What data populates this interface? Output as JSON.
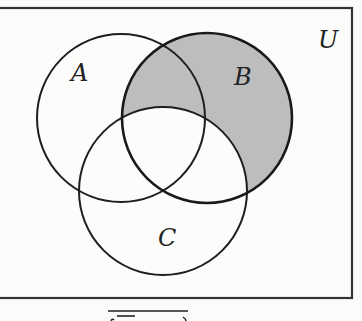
{
  "diagram": {
    "type": "venn",
    "universe": {
      "label": "U",
      "border_color": "#333333",
      "box": {
        "x": -4,
        "y": 8,
        "width": 356,
        "height": 290
      }
    },
    "sets": [
      {
        "id": "A",
        "label": "A",
        "cx": 121,
        "cy": 118,
        "r": 84,
        "label_x": 71,
        "label_y": 81
      },
      {
        "id": "B",
        "label": "B",
        "cx": 207,
        "cy": 118,
        "r": 85,
        "label_x": 234,
        "label_y": 85
      },
      {
        "id": "C",
        "label": "C",
        "cx": 163,
        "cy": 191,
        "r": 84,
        "label_x": 158,
        "label_y": 246
      }
    ],
    "shaded_region": {
      "description": "B minus C (B ∩ C')",
      "fill_color": "#bdbdbd"
    },
    "stroke_color": "#1e1e1e",
    "bottom_formula_fragment": "overline( overline(…) … )"
  }
}
